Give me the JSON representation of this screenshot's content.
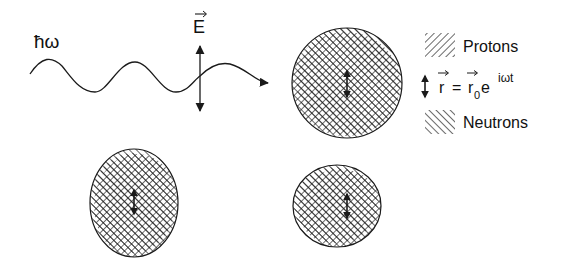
{
  "diagram": {
    "photon_label": "ħω",
    "field_label": "E",
    "legend": {
      "protons_label": "Protons",
      "neutrons_label": "Neutrons",
      "oscillation_r": "r",
      "oscillation_equals": "=",
      "oscillation_r0": "r",
      "oscillation_sub": "0",
      "oscillation_e": "e",
      "oscillation_exp": "iωt"
    },
    "colors": {
      "ink": "#1a1a1a",
      "background": "#ffffff"
    },
    "nuclei": [
      {
        "name": "nucleus-spherical",
        "cx": 347,
        "cy": 83,
        "rx": 55,
        "ry": 55
      },
      {
        "name": "nucleus-prolate",
        "cx": 134,
        "cy": 203,
        "rx": 44,
        "ry": 54
      },
      {
        "name": "nucleus-oblate",
        "cx": 337,
        "cy": 206,
        "rx": 44,
        "ry": 41
      }
    ]
  }
}
